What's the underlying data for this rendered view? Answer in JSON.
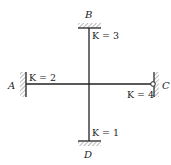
{
  "diagram": {
    "type": "structural-frame",
    "joint": {
      "x": 89,
      "y": 84
    },
    "nodes": [
      {
        "id": "A",
        "label": "A",
        "support": "fixed",
        "side": "left"
      },
      {
        "id": "B",
        "label": "B",
        "support": "fixed",
        "side": "top"
      },
      {
        "id": "C",
        "label": "C",
        "support": "pinned",
        "side": "right"
      },
      {
        "id": "D",
        "label": "D",
        "support": "fixed",
        "side": "bottom"
      }
    ],
    "members": [
      {
        "from": "A",
        "to": "joint",
        "stiffness_label": "K = 2",
        "k_var": "K",
        "k_value": "2"
      },
      {
        "from": "B",
        "to": "joint",
        "stiffness_label": "K = 3",
        "k_var": "K",
        "k_value": "3"
      },
      {
        "from": "C",
        "to": "joint",
        "stiffness_label": "K = 4",
        "k_var": "K",
        "k_value": "4"
      },
      {
        "from": "D",
        "to": "joint",
        "stiffness_label": "K = 1",
        "k_var": "K",
        "k_value": "1"
      }
    ],
    "colors": {
      "line": "#222222",
      "hatch": "#777777",
      "background": "#ffffff"
    }
  }
}
